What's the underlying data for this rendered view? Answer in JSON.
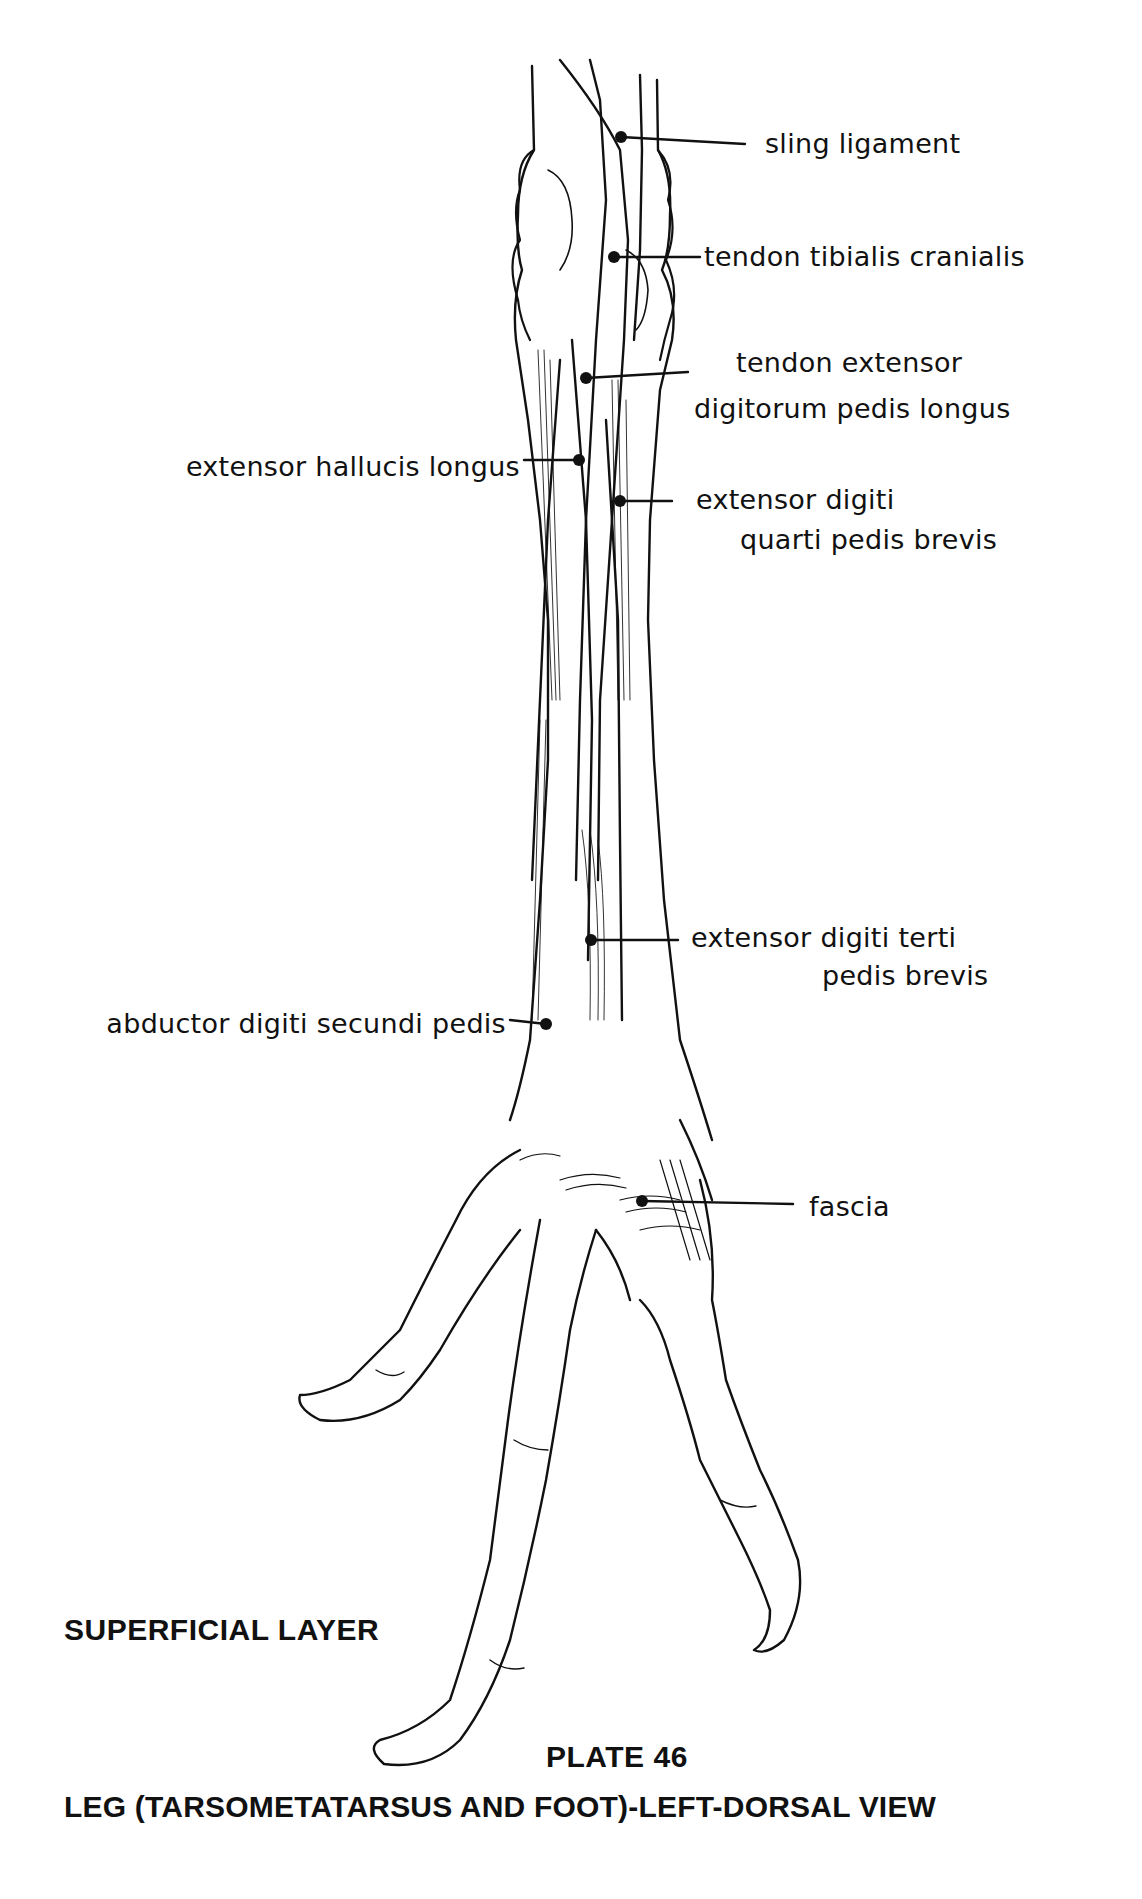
{
  "plate": {
    "layer_caption": "SUPERFICIAL LAYER",
    "plate_number": "PLATE 46",
    "title": "LEG (TARSOMETATARSUS AND FOOT)-LEFT-DORSAL VIEW"
  },
  "labels": [
    {
      "id": "sling-ligament",
      "lines": [
        "sling ligament"
      ]
    },
    {
      "id": "tendon-tibialis-cranialis",
      "lines": [
        "tendon tibialis cranialis"
      ]
    },
    {
      "id": "tendon-extensor-digitorum-pedis-longus",
      "lines": [
        "tendon extensor",
        "digitorum pedis longus"
      ]
    },
    {
      "id": "extensor-hallucis-longus",
      "lines": [
        "extensor hallucis longus"
      ]
    },
    {
      "id": "extensor-digiti-quarti-pedis-brevis",
      "lines": [
        "extensor digiti",
        "quarti pedis brevis"
      ]
    },
    {
      "id": "extensor-digiti-terti-pedis-brevis",
      "lines": [
        "extensor digiti terti",
        "pedis brevis"
      ]
    },
    {
      "id": "abductor-digiti-secundi-pedis",
      "lines": [
        "abductor digiti secundi pedis"
      ]
    },
    {
      "id": "fascia",
      "lines": [
        "fascia"
      ]
    }
  ],
  "colors": {
    "ink": "#111111",
    "paper": "#ffffff"
  }
}
